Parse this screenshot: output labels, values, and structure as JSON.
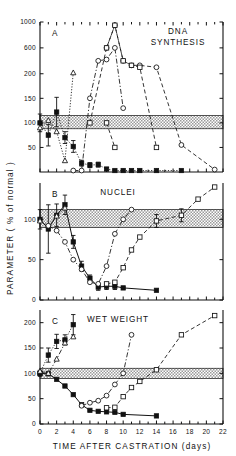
{
  "figure": {
    "y_axis_title": "PARAMETER  ( %  of  normal )",
    "x_axis_title": "TIME  AFTER  CASTRATION   (days)"
  },
  "chart_data": {
    "type": "line",
    "title": "",
    "xlabel": "TIME  AFTER  CASTRATION   (days)",
    "ylabel": "PARAMETER  ( %  of  normal )",
    "xlim": [
      0,
      22
    ],
    "xticks": [
      0,
      2,
      4,
      6,
      8,
      10,
      12,
      14,
      16,
      18,
      20,
      22
    ],
    "xticklabels": [
      "0",
      "2",
      "4",
      "6",
      "8",
      "10",
      "12",
      "14",
      "16",
      "18",
      "20",
      "22"
    ],
    "grid": false,
    "legend_position": "none",
    "panels": [
      {
        "tag": "A",
        "title": "DNA\nSYNTHESIS",
        "title_lines": [
          "DNA",
          "SYNTHESIS"
        ],
        "yticks": [
          50,
          100,
          150,
          200,
          600,
          1000
        ],
        "yticklabels": [
          "50",
          "100",
          "150",
          "200",
          "600",
          "1000"
        ],
        "ylim": [
          0,
          1000
        ],
        "normal_band": {
          "low": 88,
          "high": 115,
          "label": "normal range"
        },
        "series": [
          {
            "name": "filled-square-early",
            "marker": "filled-square",
            "linestyle": "dotted",
            "x": [
              0,
              1,
              2,
              3,
              4,
              5,
              6,
              7,
              8,
              9,
              10,
              11,
              12,
              14,
              17
            ],
            "y": [
              100,
              75,
              122,
              70,
              52,
              18,
              14,
              15,
              6,
              3,
              3,
              3,
              3,
              3,
              3
            ],
            "errors": [
              18,
              22,
              30,
              12,
              12,
              6,
              5,
              5,
              3,
              0,
              0,
              0,
              0,
              0,
              0
            ]
          },
          {
            "name": "open-triangle",
            "marker": "open-triangle",
            "linestyle": "dotted",
            "x": [
              0,
              1,
              2,
              3,
              4
            ],
            "y": [
              90,
              105,
              82,
              23,
              215
            ],
            "errors": [
              0,
              0,
              0,
              0,
              0
            ]
          },
          {
            "name": "open-circle",
            "marker": "open-circle",
            "linestyle": "dashdot",
            "x": [
              4,
              5,
              6,
              7,
              8,
              9,
              10
            ],
            "y": [
              3,
              3,
              150,
              400,
              420,
              600,
              130
            ],
            "errors": [
              0,
              0,
              0,
              0,
              0,
              0,
              0
            ]
          },
          {
            "name": "open-circle-peak",
            "marker": "open-circle",
            "linestyle": "dashed",
            "x": [
              8,
              9,
              10,
              11,
              12,
              14,
              17,
              21
            ],
            "y": [
              600,
              950,
              400,
              330,
              330,
              300,
              55,
              5
            ],
            "errors": [
              0,
              0,
              0,
              0,
              0,
              0,
              0,
              0
            ]
          },
          {
            "name": "open-square",
            "marker": "open-square",
            "linestyle": "dashed",
            "x": [
              6,
              8,
              9,
              10,
              11,
              12,
              14
            ],
            "y": [
              100,
              600,
              950,
              400,
              330,
              300,
              50
            ],
            "errors": [
              0,
              0,
              0,
              0,
              0,
              0,
              0
            ]
          },
          {
            "name": "open-square-drop",
            "marker": "open-square",
            "linestyle": "dashed",
            "x": [
              8,
              9
            ],
            "y": [
              100,
              50
            ],
            "errors": [
              0,
              0
            ]
          }
        ]
      },
      {
        "tag": "B",
        "title": "NUCLEI",
        "title_lines": [
          "NUCLEI"
        ],
        "yticks": [
          0,
          50,
          100
        ],
        "yticklabels": [
          "0",
          "50",
          "100"
        ],
        "ylim": [
          0,
          145
        ],
        "normal_band": {
          "low": 90,
          "high": 112,
          "label": "normal range"
        },
        "series": [
          {
            "name": "filled-square",
            "marker": "filled-square",
            "linestyle": "solid",
            "x": [
              0,
              1,
              2,
              3,
              4,
              5,
              6,
              7,
              8,
              9,
              10,
              14
            ],
            "y": [
              100,
              88,
              105,
              118,
              72,
              42,
              27,
              16,
              17,
              17,
              15,
              12
            ],
            "errors": [
              12,
              30,
              14,
              12,
              8,
              6,
              4,
              4,
              4,
              4,
              0,
              0
            ]
          },
          {
            "name": "open-triangle",
            "marker": "open-triangle",
            "linestyle": "dotted",
            "x": [
              0,
              1,
              2,
              3
            ],
            "y": [
              98,
              92,
              104,
              114
            ],
            "errors": [
              0,
              0,
              0,
              0
            ]
          },
          {
            "name": "open-circle",
            "marker": "open-circle",
            "linestyle": "dashdot",
            "x": [
              1,
              2,
              3,
              4,
              5,
              6,
              7,
              8,
              9,
              10,
              11
            ],
            "y": [
              92,
              86,
              72,
              50,
              38,
              22,
              20,
              42,
              82,
              100,
              112
            ],
            "errors": [
              0,
              0,
              0,
              0,
              0,
              0,
              0,
              0,
              0,
              0,
              0
            ]
          },
          {
            "name": "open-square",
            "marker": "open-square",
            "linestyle": "dashed",
            "x": [
              8,
              9,
              10,
              11,
              12,
              14,
              17,
              19,
              21
            ],
            "y": [
              20,
              22,
              40,
              62,
              78,
              98,
              105,
              125,
              140
            ],
            "errors": [
              0,
              0,
              0,
              0,
              0,
              8,
              8,
              0,
              0
            ]
          }
        ]
      },
      {
        "tag": "C",
        "title": "WET  WEIGHT",
        "title_lines": [
          "WET  WEIGHT"
        ],
        "yticks": [
          0,
          50,
          100,
          150,
          200
        ],
        "yticklabels": [
          "0",
          "50",
          "100",
          "150",
          "200"
        ],
        "ylim": [
          0,
          225
        ],
        "normal_band": {
          "low": 90,
          "high": 110,
          "label": "normal range"
        },
        "series": [
          {
            "name": "filled-square-rise",
            "marker": "filled-square",
            "linestyle": "dotted",
            "x": [
              0,
              1,
              2,
              3,
              4
            ],
            "y": [
              100,
              136,
              163,
              166,
              196
            ],
            "errors": [
              6,
              14,
              14,
              10,
              20
            ]
          },
          {
            "name": "filled-square-fall",
            "marker": "filled-square",
            "linestyle": "solid",
            "x": [
              0,
              1,
              2,
              3,
              4,
              5,
              6,
              7,
              8,
              9,
              10,
              14
            ],
            "y": [
              100,
              99,
              88,
              75,
              58,
              38,
              27,
              25,
              24,
              23,
              19,
              16
            ]
          },
          {
            "name": "open-triangle",
            "marker": "open-triangle",
            "linestyle": "dashdot",
            "x": [
              0,
              1,
              2,
              3,
              4
            ],
            "y": [
              104,
              100,
              128,
              160,
              172
            ],
            "errors": [
              0,
              0,
              0,
              0,
              0
            ]
          },
          {
            "name": "open-circle",
            "marker": "open-circle",
            "linestyle": "dashdot",
            "x": [
              5,
              6,
              7,
              8,
              9,
              10,
              11
            ],
            "y": [
              36,
              42,
              46,
              56,
              78,
              100,
              176
            ],
            "errors": [
              0,
              0,
              0,
              0,
              0,
              0,
              0
            ]
          },
          {
            "name": "open-square",
            "marker": "open-square",
            "linestyle": "dashed",
            "x": [
              8,
              9,
              10,
              11,
              12,
              14,
              17,
              21
            ],
            "y": [
              32,
              33,
              54,
              72,
              84,
              107,
              176,
              214
            ],
            "errors": [
              0,
              0,
              0,
              0,
              0,
              0,
              0,
              0
            ]
          }
        ]
      }
    ]
  }
}
